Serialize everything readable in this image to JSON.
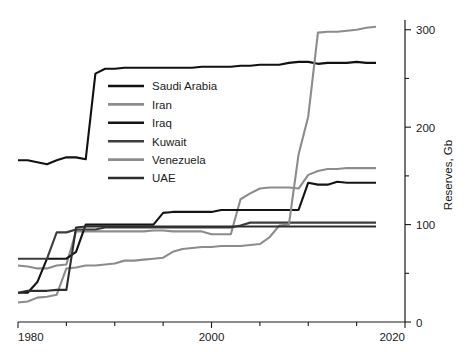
{
  "chart_data": {
    "type": "line",
    "title": "",
    "xlabel": "",
    "ylabel": "Reserves, Gb",
    "xlim": [
      1980,
      2020
    ],
    "ylim": [
      0,
      310
    ],
    "grid": false,
    "legend_position": "upper-left-inside",
    "x_ticks_major": [
      1980,
      2000,
      2020
    ],
    "x_ticks_minor": [
      1985,
      1990,
      1995,
      2005,
      2010,
      2015
    ],
    "y_ticks_major": [
      0,
      100,
      200,
      300
    ],
    "y_ticks_minor": [
      50,
      150,
      250
    ],
    "y_axis_side": "right",
    "x": [
      1980,
      1981,
      1982,
      1983,
      1984,
      1985,
      1986,
      1987,
      1988,
      1989,
      1990,
      1991,
      1992,
      1993,
      1994,
      1995,
      1996,
      1997,
      1998,
      1999,
      2000,
      2001,
      2002,
      2003,
      2004,
      2005,
      2006,
      2007,
      2008,
      2009,
      2010,
      2011,
      2012,
      2013,
      2014,
      2015,
      2016,
      2017
    ],
    "series": [
      {
        "name": "Saudi Arabia",
        "color": "#111111",
        "values": [
          166,
          166,
          164,
          162,
          166,
          169,
          169,
          167,
          255,
          260,
          260,
          261,
          261,
          261,
          261,
          261,
          261,
          261,
          261,
          262,
          262,
          262,
          262,
          263,
          263,
          264,
          264,
          264,
          266,
          267,
          267,
          265,
          266,
          266,
          266,
          267,
          266,
          266
        ]
      },
      {
        "name": "Iran",
        "color": "#8c8c8c",
        "values": [
          58,
          57,
          55,
          55,
          58,
          59,
          93,
          93,
          93,
          93,
          93,
          93,
          93,
          93,
          94,
          94,
          93,
          93,
          93,
          93,
          90,
          90,
          90,
          126,
          132,
          137,
          138,
          138,
          138,
          137,
          151,
          155,
          157,
          157,
          158,
          158,
          158,
          158
        ]
      },
      {
        "name": "Iraq",
        "color": "#141414",
        "values": [
          30,
          30,
          41,
          65,
          65,
          65,
          72,
          100,
          100,
          100,
          100,
          100,
          100,
          100,
          100,
          112,
          113,
          113,
          113,
          113,
          113,
          115,
          115,
          115,
          115,
          115,
          115,
          115,
          115,
          115,
          143,
          141,
          141,
          144,
          143,
          143,
          143,
          143
        ]
      },
      {
        "name": "Kuwait",
        "color": "#3d3d3d",
        "values": [
          65,
          65,
          65,
          65,
          92,
          92,
          95,
          95,
          95,
          97,
          97,
          97,
          97,
          97,
          97,
          97,
          97,
          97,
          97,
          97,
          97,
          97,
          97,
          99,
          102,
          102,
          102,
          102,
          102,
          102,
          102,
          102,
          102,
          102,
          102,
          102,
          102,
          102
        ]
      },
      {
        "name": "Venezuela",
        "color": "#8c8c8c",
        "values": [
          20,
          21,
          25,
          26,
          28,
          55,
          56,
          58,
          58,
          59,
          60,
          63,
          63,
          64,
          65,
          66,
          72,
          75,
          76,
          77,
          77,
          78,
          78,
          78,
          79,
          80,
          87,
          99,
          100,
          172,
          211,
          297,
          298,
          298,
          299,
          300,
          302,
          303
        ]
      },
      {
        "name": "UAE",
        "color": "#2e2e2e",
        "values": [
          30,
          32,
          32,
          32,
          33,
          33,
          97,
          98,
          98,
          98,
          98,
          98,
          98,
          98,
          98,
          98,
          98,
          98,
          98,
          98,
          98,
          98,
          98,
          98,
          98,
          98,
          98,
          98,
          98,
          98,
          98,
          98,
          98,
          98,
          98,
          98,
          98,
          98
        ]
      }
    ],
    "axis_tick_labels": {
      "x": [
        "1980",
        "2000",
        "2020"
      ],
      "y": [
        "0",
        "100",
        "200",
        "300"
      ]
    }
  },
  "legend": {
    "entries": [
      {
        "label": "Saudi Arabia"
      },
      {
        "label": "Iran"
      },
      {
        "label": "Iraq"
      },
      {
        "label": "Kuwait"
      },
      {
        "label": "Venezuela"
      },
      {
        "label": "UAE"
      }
    ]
  },
  "axes": {
    "y_title": "Reserves, Gb"
  }
}
